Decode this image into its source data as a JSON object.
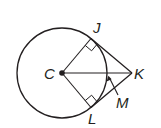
{
  "diagram": {
    "type": "geometry",
    "colors": {
      "stroke": "#231f20",
      "background": "#ffffff"
    },
    "circle": {
      "center_label": "C",
      "cx": 62,
      "cy": 73,
      "r": 45
    },
    "points": {
      "C": {
        "label": "C",
        "x": 62,
        "y": 73
      },
      "J": {
        "label": "J",
        "x": 91,
        "y": 38.5
      },
      "K": {
        "label": "K",
        "x": 132,
        "y": 73
      },
      "L": {
        "label": "L",
        "x": 91,
        "y": 107.5
      },
      "M": {
        "label": "M",
        "x": 107,
        "y": 73
      }
    },
    "segments": [
      "CJ",
      "CL",
      "CK",
      "JK",
      "LK"
    ],
    "right_angles": [
      "CJK",
      "CLK"
    ],
    "labels": {
      "C": "C",
      "J": "J",
      "K": "K",
      "L": "L",
      "M": "M"
    }
  }
}
